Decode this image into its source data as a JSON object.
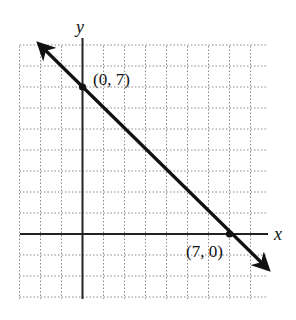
{
  "chart_data": {
    "type": "line",
    "title": "",
    "xlabel": "x",
    "ylabel": "y",
    "xlim": [
      -3,
      9
    ],
    "ylim": [
      -3,
      9
    ],
    "grid": true,
    "grid_style": "dotted",
    "series": [
      {
        "name": "line through (0, 7) and (7, 0)",
        "equation": "x + y = 7",
        "x": [
          0,
          7
        ],
        "y": [
          7,
          0
        ],
        "extends_both_directions": true
      }
    ],
    "annotations": [
      {
        "text": "(0, 7)",
        "x": 0,
        "y": 7
      },
      {
        "text": "(7, 0)",
        "x": 7,
        "y": 0
      }
    ]
  },
  "labels": {
    "x_axis": "x",
    "y_axis": "y",
    "point_a": "(0, 7)",
    "point_b": "(7, 0)"
  },
  "colors": {
    "line": "#111111",
    "grid": "#888888",
    "axis": "#222222"
  }
}
